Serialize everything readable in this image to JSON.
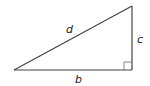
{
  "diagram": {
    "type": "right-triangle",
    "vertices": {
      "left": [
        14,
        70
      ],
      "right_angle": [
        132,
        70
      ],
      "top": [
        132,
        6
      ]
    },
    "labels": {
      "hypotenuse": "d",
      "vertical_leg": "c",
      "horizontal_leg": "b"
    },
    "right_angle_marker": true,
    "stroke_color": "#444444"
  }
}
